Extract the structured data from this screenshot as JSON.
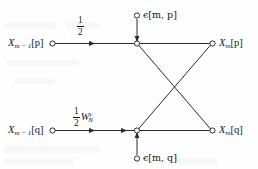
{
  "figure": {
    "type": "signal-flow-graph",
    "background_color": "#fefefe",
    "line_color": "#2b2b2b"
  },
  "nodes": {
    "input_top": {
      "label": "X",
      "sub": "m − 1",
      "index": "[p]"
    },
    "input_bottom": {
      "label": "X",
      "sub": "m − 1",
      "index": "[q]"
    },
    "output_top": {
      "label": "X",
      "sub": "m",
      "index": "[p]"
    },
    "output_bottom": {
      "label": "X",
      "sub": "m",
      "index": "[q]"
    },
    "error_top": {
      "label": "ϵ[m, p]"
    },
    "error_bottom": {
      "label": "ϵ[m, q]"
    }
  },
  "gains": {
    "top": {
      "numerator": "1",
      "denominator": "2",
      "factor": ""
    },
    "bottom": {
      "numerator": "1",
      "denominator": "2",
      "factor": "W",
      "factor_sub": "N",
      "factor_sup": "r"
    }
  },
  "edges": [
    {
      "name": "top-input-to-node",
      "from": "input_top",
      "to": "butterfly_top",
      "arrow": true
    },
    {
      "name": "bottom-input-to-node",
      "from": "input_bottom",
      "to": "butterfly_bottom",
      "arrow": true
    },
    {
      "name": "error-top-injection",
      "from": "error_top",
      "to": "butterfly_top",
      "arrow": true
    },
    {
      "name": "error-bottom-injection",
      "from": "error_bottom",
      "to": "butterfly_bottom",
      "arrow": true
    },
    {
      "name": "top-node-to-top-output",
      "from": "butterfly_top",
      "to": "output_top",
      "arrow": false
    },
    {
      "name": "bottom-node-to-bottom-output",
      "from": "butterfly_bottom",
      "to": "output_bottom",
      "arrow": false
    },
    {
      "name": "top-node-to-bottom-output",
      "from": "butterfly_top",
      "to": "output_bottom",
      "arrow": false
    },
    {
      "name": "bottom-node-to-top-output",
      "from": "butterfly_bottom",
      "to": "output_top",
      "arrow": false
    }
  ]
}
